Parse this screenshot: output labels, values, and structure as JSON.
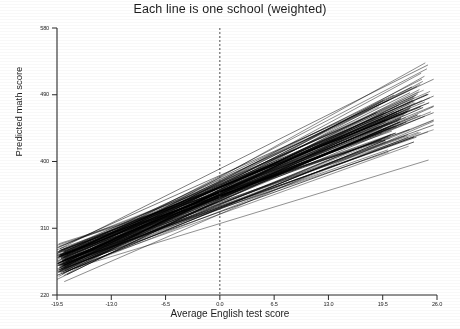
{
  "chart_data": {
    "type": "line",
    "title": "Each line is one school (weighted)",
    "xlabel": "Average English test score",
    "ylabel": "Predicted math score",
    "xlim": [
      -19.5,
      26.0
    ],
    "ylim": [
      220,
      580
    ],
    "xticks": [
      "-19.5",
      "-13.0",
      "-6.5",
      "0.0",
      "6.5",
      "13.0",
      "19.5",
      "26.0"
    ],
    "xtick_values": [
      -19.5,
      -13.0,
      -6.5,
      0.0,
      6.5,
      13.0,
      19.5,
      26.0
    ],
    "yticks": [
      "220",
      "310",
      "400",
      "490",
      "580"
    ],
    "ytick_values": [
      220,
      310,
      400,
      490,
      580
    ],
    "grid": false,
    "legend": null,
    "annotations": [
      {
        "name": "reference-line",
        "type": "vline",
        "x": 0.0,
        "style": "dashed"
      }
    ],
    "series": [
      {
        "name": "school-001",
        "x": [
          -19.5,
          23.6
        ],
        "values": [
          268,
          501
        ]
      },
      {
        "name": "school-002",
        "x": [
          -19.5,
          22.8
        ],
        "values": [
          262,
          472
        ]
      },
      {
        "name": "school-003",
        "x": [
          -19.2,
          24.1
        ],
        "values": [
          256,
          519
        ]
      },
      {
        "name": "school-004",
        "x": [
          -19.5,
          21.4
        ],
        "values": [
          274,
          455
        ]
      },
      {
        "name": "school-005",
        "x": [
          -18.9,
          23.2
        ],
        "values": [
          248,
          487
        ]
      },
      {
        "name": "school-006",
        "x": [
          -19.5,
          20.6
        ],
        "values": [
          281,
          441
        ]
      },
      {
        "name": "school-007",
        "x": [
          -19.1,
          24.6
        ],
        "values": [
          259,
          533
        ]
      },
      {
        "name": "school-008",
        "x": [
          -19.5,
          22.1
        ],
        "values": [
          266,
          463
        ]
      },
      {
        "name": "school-009",
        "x": [
          -18.6,
          23.9
        ],
        "values": [
          252,
          497
        ]
      },
      {
        "name": "school-010",
        "x": [
          -19.5,
          19.8
        ],
        "values": [
          287,
          429
        ]
      },
      {
        "name": "school-011",
        "x": [
          -19.3,
          24.3
        ],
        "values": [
          245,
          508
        ]
      },
      {
        "name": "school-012",
        "x": [
          -19.5,
          21.9
        ],
        "values": [
          271,
          451
        ]
      },
      {
        "name": "school-013",
        "x": [
          -18.8,
          23.4
        ],
        "values": [
          263,
          479
        ]
      },
      {
        "name": "school-014",
        "x": [
          -19.5,
          22.6
        ],
        "values": [
          255,
          469
        ]
      },
      {
        "name": "school-015",
        "x": [
          -19.0,
          24.8
        ],
        "values": [
          269,
          525
        ]
      },
      {
        "name": "school-016",
        "x": [
          -19.5,
          20.2
        ],
        "values": [
          278,
          434
        ]
      },
      {
        "name": "school-017",
        "x": [
          -19.4,
          23.1
        ],
        "values": [
          250,
          483
        ]
      },
      {
        "name": "school-018",
        "x": [
          -18.5,
          24.0
        ],
        "values": [
          264,
          504
        ]
      },
      {
        "name": "school-019",
        "x": [
          -19.5,
          21.2
        ],
        "values": [
          273,
          447
        ]
      },
      {
        "name": "school-020",
        "x": [
          -19.2,
          23.7
        ],
        "values": [
          257,
          491
        ]
      },
      {
        "name": "school-021",
        "x": [
          -19.5,
          22.4
        ],
        "values": [
          284,
          466
        ]
      },
      {
        "name": "school-022",
        "x": [
          -18.7,
          24.5
        ],
        "values": [
          246,
          515
        ]
      },
      {
        "name": "school-023",
        "x": [
          -19.5,
          20.9
        ],
        "values": [
          276,
          438
        ]
      },
      {
        "name": "school-024",
        "x": [
          -19.1,
          23.3
        ],
        "values": [
          261,
          486
        ]
      },
      {
        "name": "school-025",
        "x": [
          -19.5,
          21.7
        ],
        "values": [
          253,
          458
        ]
      },
      {
        "name": "school-026",
        "x": [
          -18.9,
          24.2
        ],
        "values": [
          267,
          511
        ]
      },
      {
        "name": "school-027",
        "x": [
          -19.5,
          22.9
        ],
        "values": [
          241,
          474
        ]
      },
      {
        "name": "school-028",
        "x": [
          -19.3,
          20.4
        ],
        "values": [
          289,
          432
        ]
      },
      {
        "name": "school-029",
        "x": [
          -18.6,
          23.8
        ],
        "values": [
          258,
          494
        ]
      },
      {
        "name": "school-030",
        "x": [
          -19.5,
          21.5
        ],
        "values": [
          270,
          453
        ]
      }
    ],
    "n_lines": 120,
    "slope_range": [
      3.3,
      6.2
    ],
    "intercept_range_at_xmin": [
      238,
      292
    ]
  }
}
